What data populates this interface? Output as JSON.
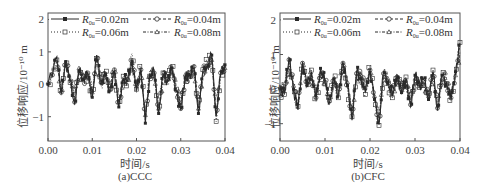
{
  "chart_data": [
    {
      "type": "line",
      "caption": "(a)CCC",
      "xlabel": "时间/s",
      "ylabel": "位移响应/10⁻¹⁰ m",
      "xlim": [
        0.0,
        0.04
      ],
      "ylim": [
        -1.75,
        2.2
      ],
      "xticks": [
        "0.00",
        "0.01",
        "0.02",
        "0.03",
        "0.04"
      ],
      "yticks": [
        "2",
        "1",
        "0",
        "−1"
      ],
      "grid": false,
      "legend_position": "upper-left",
      "x": [
        0.0,
        0.002,
        0.003,
        0.004,
        0.005,
        0.006,
        0.007,
        0.008,
        0.009,
        0.01,
        0.011,
        0.012,
        0.013,
        0.014,
        0.015,
        0.016,
        0.017,
        0.018,
        0.019,
        0.02,
        0.021,
        0.022,
        0.023,
        0.024,
        0.025,
        0.026,
        0.027,
        0.028,
        0.029,
        0.03,
        0.031,
        0.032,
        0.033,
        0.034,
        0.035,
        0.036,
        0.037,
        0.038,
        0.039,
        0.04
      ],
      "series": [
        {
          "name": "R0u=0.02m",
          "marker": "filled-square",
          "style": "solid",
          "values": [
            0.0,
            0.85,
            -0.3,
            0.7,
            0.1,
            -0.6,
            0.4,
            0.2,
            0.3,
            -0.4,
            0.9,
            0.0,
            0.3,
            -0.2,
            0.4,
            -0.7,
            0.2,
            0.1,
            0.7,
            -0.2,
            0.5,
            -1.2,
            0.3,
            0.4,
            -0.9,
            0.3,
            0.1,
            0.5,
            -0.2,
            -0.8,
            0.2,
            0.3,
            0.5,
            -0.9,
            0.4,
            0.6,
            0.9,
            -1.0,
            0.3,
            0.6
          ]
        },
        {
          "name": "R0u=0.04m",
          "marker": "crossed-circle",
          "style": "dashed",
          "values": [
            0.0,
            0.8,
            -0.25,
            0.65,
            0.15,
            -0.55,
            0.45,
            0.15,
            0.35,
            -0.35,
            0.85,
            0.05,
            0.25,
            -0.25,
            0.45,
            -0.65,
            0.15,
            0.15,
            0.75,
            -0.25,
            0.45,
            -1.1,
            0.35,
            0.35,
            -0.85,
            0.25,
            0.15,
            0.45,
            -0.25,
            -0.75,
            0.25,
            0.25,
            0.55,
            -0.85,
            0.35,
            0.55,
            0.85,
            -0.95,
            0.35,
            0.55
          ]
        },
        {
          "name": "R0u=0.06m",
          "marker": "dotted-square",
          "style": "dotted",
          "values": [
            -0.05,
            0.75,
            -0.35,
            0.75,
            0.05,
            -0.5,
            0.35,
            0.25,
            0.25,
            -0.3,
            0.8,
            -0.05,
            0.35,
            -0.15,
            0.35,
            -0.6,
            0.25,
            0.05,
            0.95,
            -0.15,
            0.55,
            -1.0,
            0.25,
            0.45,
            -0.8,
            0.35,
            0.05,
            0.55,
            -0.15,
            -0.7,
            0.15,
            0.35,
            0.45,
            -0.8,
            0.45,
            0.65,
            0.8,
            -1.15,
            0.25,
            0.65
          ]
        },
        {
          "name": "R0u=0.08m",
          "marker": "triangle",
          "style": "dash-dot",
          "values": [
            0.05,
            0.7,
            -0.2,
            0.6,
            0.2,
            -0.45,
            0.5,
            0.1,
            0.4,
            -0.25,
            0.75,
            0.1,
            0.2,
            -0.1,
            0.5,
            -0.55,
            0.1,
            0.2,
            0.65,
            -0.1,
            0.4,
            -0.95,
            0.4,
            0.3,
            -0.75,
            0.2,
            0.2,
            0.4,
            -0.1,
            -0.65,
            0.3,
            0.2,
            0.6,
            -0.75,
            0.3,
            0.5,
            0.75,
            -0.9,
            0.4,
            0.5
          ]
        }
      ]
    },
    {
      "type": "line",
      "caption": "(b)CFC",
      "xlabel": "时间/s",
      "ylabel": "位移响应/10⁻¹⁰ m",
      "xlim": [
        0.0,
        0.04
      ],
      "ylim": [
        -1.5,
        2.2
      ],
      "xticks": [
        "0.00",
        "0.01",
        "0.02",
        "0.03",
        "0.04"
      ],
      "yticks": [
        "2",
        "1",
        "0",
        "−1"
      ],
      "grid": false,
      "legend_position": "upper-left",
      "x": [
        0.0,
        0.001,
        0.002,
        0.003,
        0.004,
        0.005,
        0.006,
        0.007,
        0.008,
        0.009,
        0.01,
        0.011,
        0.012,
        0.013,
        0.014,
        0.015,
        0.016,
        0.017,
        0.018,
        0.019,
        0.02,
        0.021,
        0.022,
        0.023,
        0.024,
        0.025,
        0.026,
        0.027,
        0.028,
        0.029,
        0.03,
        0.031,
        0.032,
        0.033,
        0.034,
        0.035,
        0.036,
        0.037,
        0.038,
        0.039,
        0.04
      ],
      "series": [
        {
          "name": "R0u=0.02m",
          "marker": "filled-square",
          "style": "solid",
          "values": [
            0.0,
            -0.1,
            0.9,
            0.0,
            -0.6,
            0.8,
            0.1,
            0.5,
            -0.3,
            0.6,
            0.2,
            -0.4,
            0.3,
            -0.2,
            0.8,
            0.1,
            -0.9,
            0.5,
            0.3,
            -0.1,
            0.6,
            -0.3,
            -1.0,
            0.5,
            0.2,
            -0.2,
            0.4,
            -0.1,
            0.3,
            -0.5,
            0.4,
            0.1,
            0.3,
            -0.3,
            0.5,
            -0.6,
            0.4,
            0.2,
            -0.3,
            0.5,
            1.3
          ]
        },
        {
          "name": "R0u=0.04m",
          "marker": "crossed-circle",
          "style": "dashed",
          "values": [
            0.0,
            -0.05,
            0.85,
            0.05,
            -0.55,
            0.75,
            0.15,
            0.45,
            -0.25,
            0.55,
            0.25,
            -0.35,
            0.25,
            -0.15,
            0.75,
            0.15,
            -0.85,
            0.45,
            0.35,
            -0.05,
            0.55,
            -0.25,
            -0.95,
            0.45,
            0.25,
            -0.15,
            0.35,
            -0.05,
            0.25,
            -0.45,
            0.35,
            0.15,
            0.25,
            -0.25,
            0.45,
            -0.55,
            0.35,
            0.25,
            -0.25,
            0.45,
            1.2
          ]
        },
        {
          "name": "R0u=0.06m",
          "marker": "dotted-square",
          "style": "dotted",
          "values": [
            -0.05,
            -0.15,
            0.8,
            -0.05,
            -0.5,
            0.7,
            0.05,
            0.55,
            -0.35,
            0.5,
            0.15,
            -0.45,
            0.35,
            -0.25,
            0.7,
            0.05,
            -0.8,
            0.55,
            0.25,
            -0.15,
            0.65,
            -0.35,
            -1.05,
            0.55,
            0.15,
            -0.25,
            0.45,
            -0.15,
            0.35,
            -0.55,
            0.45,
            0.05,
            0.35,
            -0.35,
            0.55,
            -0.65,
            0.45,
            0.15,
            -0.35,
            0.55,
            1.35
          ]
        },
        {
          "name": "R0u=0.08m",
          "marker": "triangle",
          "style": "dash-dot",
          "values": [
            0.05,
            0.0,
            0.75,
            0.1,
            -0.45,
            0.65,
            0.2,
            0.4,
            -0.2,
            0.45,
            0.3,
            -0.3,
            0.2,
            -0.1,
            0.65,
            0.2,
            -0.75,
            0.4,
            0.4,
            0.0,
            0.5,
            -0.2,
            -0.9,
            0.4,
            0.3,
            -0.1,
            0.3,
            0.0,
            0.2,
            -0.4,
            0.3,
            0.2,
            0.2,
            -0.2,
            0.4,
            -0.5,
            0.3,
            0.3,
            -0.2,
            0.4,
            1.1
          ]
        }
      ]
    }
  ],
  "panels": [
    {
      "caption": "(a)CCC",
      "xlabel": "时间/s",
      "ylabel": "位移响应/10⁻¹⁰ m",
      "legend": [
        "R0u=0.02m",
        "R0u=0.04m",
        "R0u=0.06m",
        "R0u=0.08m"
      ]
    },
    {
      "caption": "(b)CFC",
      "xlabel": "时间/s",
      "ylabel": "位移响应/10⁻¹⁰ m",
      "legend": [
        "R0u=0.02m",
        "R0u=0.04m",
        "R0u=0.06m",
        "R0u=0.08m"
      ]
    }
  ],
  "legend_labels": {
    "r1": "=0.02m",
    "r2": "=0.04m",
    "r3": "=0.06m",
    "r4": "=0.08m",
    "symbol": "R",
    "sub": "0u"
  },
  "colors": {
    "line": "#2a2a2a",
    "axis": "#555555",
    "text": "#444444"
  }
}
